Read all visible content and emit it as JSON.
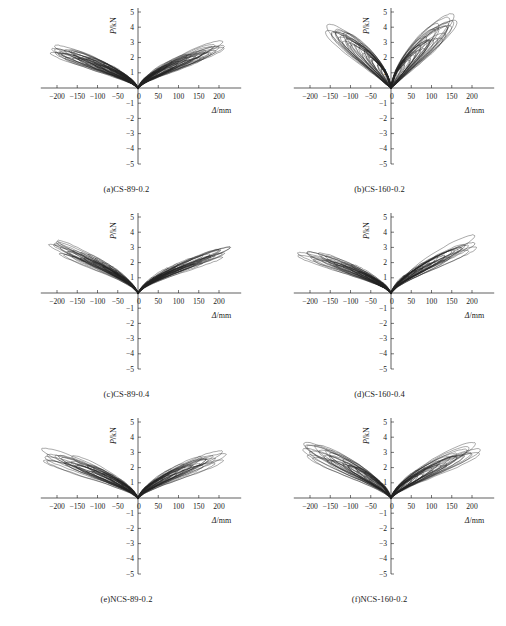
{
  "figure": {
    "background": "#ffffff",
    "line_color": "#222222",
    "axis_color": "#1a1a1a",
    "columns": 2,
    "rows": 3
  },
  "axes": {
    "x_label_var": "Δ",
    "x_label_unit": "/mm",
    "y_label_var": "P",
    "y_label_unit": "/kN",
    "x_ticks": [
      -200,
      -150,
      -100,
      -50,
      0,
      50,
      100,
      150,
      200
    ],
    "y_ticks": [
      -5,
      -4,
      -3,
      -2,
      -1,
      1,
      2,
      3,
      4,
      5
    ],
    "x_tick_labels": [
      "−200",
      "−150",
      "−100",
      "−50",
      "0",
      "50",
      "100",
      "150",
      "200"
    ],
    "y_tick_labels": [
      "−5",
      "−4",
      "−3",
      "−2",
      "−1",
      "1",
      "2",
      "3",
      "4",
      "5"
    ],
    "xlim": [
      -240,
      240
    ],
    "ylim": [
      -5,
      5
    ],
    "grid": false,
    "legend": "none"
  },
  "chart_data": {
    "type": "line",
    "title": "",
    "xlabel": "Δ/mm",
    "ylabel": "P/kN",
    "xlim": [
      -240,
      240
    ],
    "ylim": [
      -5,
      5
    ],
    "grid": false,
    "legend_position": "none",
    "panels": [
      {
        "key": "a",
        "caption": "(a)CS-89-0.2",
        "specimen": "CS-89-0.2",
        "peak_positive_load": 2.9,
        "peak_negative_load": -2.7,
        "max_positive_disp": 205,
        "max_negative_disp": -215,
        "loop_count": 22,
        "pinching": 0.45,
        "slope": 0.0125,
        "fatness": 0.62,
        "seed": 11,
        "amplitudes": [
          20,
          30,
          42,
          55,
          70,
          85,
          100,
          118,
          135,
          150,
          165,
          180,
          195,
          205
        ],
        "style": "broad-spindle"
      },
      {
        "key": "b",
        "caption": "(b)CS-160-0.2",
        "specimen": "CS-160-0.2",
        "peak_positive_load": 4.6,
        "peak_negative_load": -4.3,
        "max_positive_disp": 165,
        "max_negative_disp": -160,
        "loop_count": 20,
        "pinching": 0.22,
        "slope": 0.035,
        "fatness": 0.78,
        "seed": 23,
        "amplitudes": [
          15,
          25,
          35,
          48,
          60,
          72,
          85,
          98,
          110,
          122,
          135,
          148,
          160
        ],
        "style": "steep-pinched"
      },
      {
        "key": "c",
        "caption": "(c)CS-89-0.4",
        "specimen": "CS-89-0.4",
        "peak_positive_load": 3.0,
        "peak_negative_load": -3.4,
        "max_positive_disp": 220,
        "max_negative_disp": -210,
        "loop_count": 26,
        "pinching": 0.58,
        "slope": 0.01,
        "fatness": 0.4,
        "seed": 37,
        "amplitudes": [
          25,
          40,
          58,
          75,
          95,
          115,
          135,
          155,
          175,
          195,
          210,
          220
        ],
        "style": "flat-dense"
      },
      {
        "key": "d",
        "caption": "(d)CS-160-0.4",
        "specimen": "CS-160-0.4",
        "peak_positive_load": 3.5,
        "peak_negative_load": -2.8,
        "max_positive_disp": 210,
        "max_negative_disp": -220,
        "loop_count": 22,
        "pinching": 0.5,
        "slope": 0.0115,
        "fatness": 0.55,
        "seed": 53,
        "amplitudes": [
          20,
          32,
          45,
          60,
          78,
          95,
          112,
          130,
          150,
          170,
          190,
          210
        ],
        "style": "broad-spindle"
      },
      {
        "key": "e",
        "caption": "(e)NCS-89-0.2",
        "specimen": "NCS-89-0.2",
        "peak_positive_load": 3.2,
        "peak_negative_load": -3.0,
        "max_positive_disp": 205,
        "max_negative_disp": -225,
        "loop_count": 24,
        "pinching": 0.42,
        "slope": 0.0125,
        "fatness": 0.6,
        "seed": 71,
        "amplitudes": [
          22,
          35,
          48,
          62,
          80,
          98,
          115,
          135,
          155,
          175,
          195,
          210
        ],
        "style": "broad-spindle"
      },
      {
        "key": "f",
        "caption": "(f)NCS-160-0.2",
        "specimen": "NCS-160-0.2",
        "peak_positive_load": 3.4,
        "peak_negative_load": -3.5,
        "max_positive_disp": 210,
        "max_negative_disp": -215,
        "loop_count": 24,
        "pinching": 0.38,
        "slope": 0.0135,
        "fatness": 0.68,
        "seed": 97,
        "amplitudes": [
          22,
          35,
          50,
          65,
          82,
          100,
          120,
          140,
          160,
          180,
          200,
          212
        ],
        "style": "broad-open"
      }
    ]
  }
}
